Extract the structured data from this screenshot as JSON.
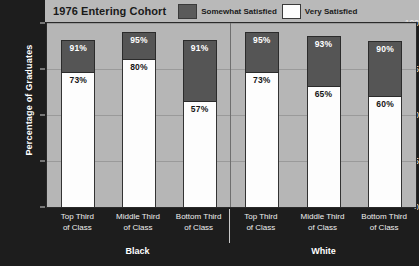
{
  "header": {
    "title": "1976 Entering Cohort"
  },
  "legend": [
    {
      "label": "Somewhat Satisfied",
      "color": "#555555",
      "icon": "legend-swatch-somewhat"
    },
    {
      "label": "Very Satisfied",
      "color": "#fdfdfd",
      "icon": "legend-swatch-very"
    }
  ],
  "axis": {
    "ylabel": "Percentage of Graduates",
    "yticks": [
      "100",
      "75",
      "50",
      "25",
      "0"
    ]
  },
  "groups": [
    {
      "name": "Black"
    },
    {
      "name": "White"
    }
  ],
  "categories": [
    {
      "line1": "Top Third",
      "line2": "of Class"
    },
    {
      "line1": "Middle Third",
      "line2": "of Class"
    },
    {
      "line1": "Bottom Third",
      "line2": "of Class"
    },
    {
      "line1": "Top Third",
      "line2": "of Class"
    },
    {
      "line1": "Middle Third",
      "line2": "of Class"
    },
    {
      "line1": "Bottom Third",
      "line2": "of Class"
    }
  ],
  "bars": [
    {
      "group": "Black",
      "category": "Top Third of Class",
      "total": 91,
      "very": 73,
      "total_label": "91%",
      "very_label": "73%"
    },
    {
      "group": "Black",
      "category": "Middle Third of Class",
      "total": 95,
      "very": 80,
      "total_label": "95%",
      "very_label": "80%"
    },
    {
      "group": "Black",
      "category": "Bottom Third of Class",
      "total": 91,
      "very": 57,
      "total_label": "91%",
      "very_label": "57%"
    },
    {
      "group": "White",
      "category": "Top Third of Class",
      "total": 95,
      "very": 73,
      "total_label": "95%",
      "very_label": "73%"
    },
    {
      "group": "White",
      "category": "Middle Third of Class",
      "total": 93,
      "very": 65,
      "total_label": "93%",
      "very_label": "65%"
    },
    {
      "group": "White",
      "category": "Bottom Third of Class",
      "total": 90,
      "very": 60,
      "total_label": "90%",
      "very_label": "60%"
    }
  ],
  "chart_data": {
    "type": "bar",
    "title": "1976 Entering Cohort",
    "xlabel": "",
    "ylabel": "Percentage of Graduates",
    "ylim": [
      0,
      100
    ],
    "yticks": [
      0,
      25,
      50,
      75,
      100
    ],
    "grid": true,
    "stacked": true,
    "legend_position": "top",
    "group_labels": [
      "Black",
      "White"
    ],
    "categories": [
      "Black / Top Third of Class",
      "Black / Middle Third of Class",
      "Black / Bottom Third of Class",
      "White / Top Third of Class",
      "White / Middle Third of Class",
      "White / Bottom Third of Class"
    ],
    "series": [
      {
        "name": "Very Satisfied",
        "values": [
          73,
          80,
          57,
          73,
          65,
          60
        ],
        "color": "#fdfdfd"
      },
      {
        "name": "Somewhat Satisfied",
        "values": [
          18,
          15,
          34,
          22,
          28,
          30
        ],
        "color": "#555555",
        "note": "cumulative tops are 91, 95, 91, 95, 93, 90"
      }
    ],
    "cumulative_tops": [
      91,
      95,
      91,
      95,
      93,
      90
    ],
    "data_labels": [
      {
        "category": "Black / Top Third of Class",
        "top": "91%",
        "bottom": "73%"
      },
      {
        "category": "Black / Middle Third of Class",
        "top": "95%",
        "bottom": "80%"
      },
      {
        "category": "Black / Bottom Third of Class",
        "top": "91%",
        "bottom": "57%"
      },
      {
        "category": "White / Top Third of Class",
        "top": "95%",
        "bottom": "73%"
      },
      {
        "category": "White / Middle Third of Class",
        "top": "93%",
        "bottom": "65%"
      },
      {
        "category": "White / Bottom Third of Class",
        "top": "90%",
        "bottom": "60%"
      }
    ]
  }
}
